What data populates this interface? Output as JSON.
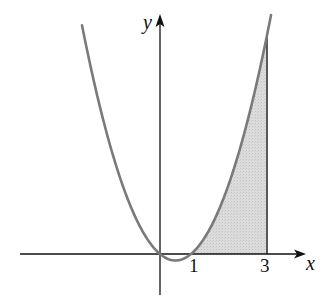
{
  "chart_data": {
    "type": "area",
    "title": "",
    "function": "y = x^2 - x",
    "xlabel": "x",
    "ylabel": "y",
    "x_tick_labels": [
      "1",
      "3"
    ],
    "x_ticks": [
      1,
      3
    ],
    "roots": [
      0,
      1
    ],
    "shaded_region": {
      "from_x": 1,
      "to_x": 3,
      "between": "curve and x-axis"
    },
    "curve_points": [
      {
        "x": -2.5,
        "y": 8.75
      },
      {
        "x": -2,
        "y": 6
      },
      {
        "x": -1.5,
        "y": 3.75
      },
      {
        "x": -1,
        "y": 2
      },
      {
        "x": -0.5,
        "y": 0.75
      },
      {
        "x": 0,
        "y": 0
      },
      {
        "x": 0.5,
        "y": -0.25
      },
      {
        "x": 1,
        "y": 0
      },
      {
        "x": 1.5,
        "y": 0.75
      },
      {
        "x": 2,
        "y": 2
      },
      {
        "x": 2.5,
        "y": 3.75
      },
      {
        "x": 3,
        "y": 6
      },
      {
        "x": 3.1,
        "y": 6.51
      }
    ],
    "grid": false,
    "legend": null,
    "colors": {
      "curve": "#7a7a7a",
      "shade": "#d9d9d9",
      "axes": "#111111"
    }
  },
  "labels": {
    "x_axis": "x",
    "y_axis": "y",
    "tick_1": "1",
    "tick_3": "3"
  }
}
